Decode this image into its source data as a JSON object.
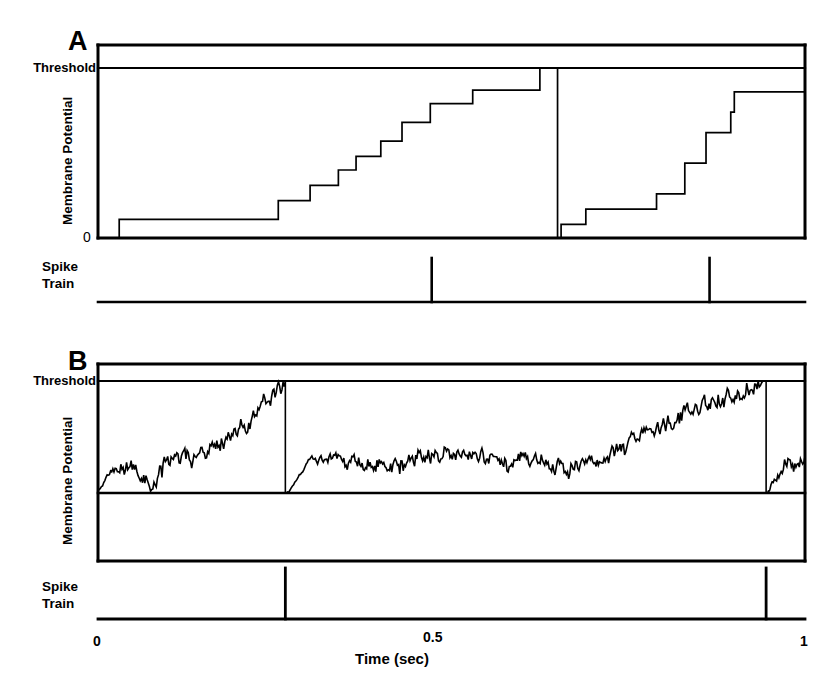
{
  "figure": {
    "background_color": "#ffffff",
    "line_color": "#000000"
  },
  "panels": [
    {
      "id": "A",
      "letter": "A",
      "threshold_label": "Threshold",
      "y_axis_label": "Membrane Potential",
      "zero_label": "0",
      "spike_train_label_line1": "Spike",
      "spike_train_label_line2": "Train",
      "description": "Noiseless integrate-and-fire: membrane potential rises in discrete steps to threshold, then resets"
    },
    {
      "id": "B",
      "letter": "B",
      "threshold_label": "Threshold",
      "y_axis_label": "Membrane Potential",
      "spike_train_label_line1": "Spike",
      "spike_train_label_line2": "Train",
      "description": "Noisy integrate-and-fire: membrane potential performs a random walk to threshold, then resets"
    }
  ],
  "x_axis": {
    "title": "Time (sec)",
    "ticks": [
      "0",
      "0.5",
      "1"
    ],
    "tick_values": [
      0,
      0.5,
      1
    ],
    "range": [
      0,
      1
    ],
    "units": "sec"
  },
  "chart_data": {
    "type": "line",
    "xlabel": "Time (sec)",
    "ylabel": "Membrane Potential",
    "xlim": [
      0,
      1
    ],
    "ylim": [
      0,
      1.15
    ],
    "grid": false,
    "legend": null,
    "xtick_labels": [
      "0",
      "0.5",
      "1"
    ],
    "xtick_values": [
      0,
      0.5,
      1
    ],
    "annotations": [
      {
        "text": "Threshold",
        "y": 1.0,
        "panel": "A"
      },
      {
        "text": "0",
        "y": 0.0,
        "panel": "A"
      },
      {
        "text": "Threshold",
        "y": 1.0,
        "panel": "B"
      }
    ],
    "series": [
      {
        "name": "Membrane Potential A (staircase)",
        "panel": "A",
        "style": "step-post",
        "x": [
          0.0,
          0.03,
          0.03,
          0.255,
          0.255,
          0.3,
          0.3,
          0.34,
          0.34,
          0.365,
          0.365,
          0.4,
          0.4,
          0.43,
          0.43,
          0.47,
          0.47,
          0.53,
          0.53,
          0.625,
          0.625,
          0.65,
          0.65,
          0.655,
          0.655,
          0.69,
          0.69,
          0.79,
          0.79,
          0.83,
          0.83,
          0.86,
          0.86,
          0.88,
          0.88,
          0.895,
          0.895,
          0.9,
          0.9,
          1.0
        ],
        "y": [
          0.0,
          0.0,
          0.11,
          0.11,
          0.22,
          0.22,
          0.31,
          0.31,
          0.4,
          0.4,
          0.48,
          0.48,
          0.57,
          0.57,
          0.68,
          0.68,
          0.79,
          0.79,
          0.87,
          0.87,
          1.0,
          1.0,
          0.0,
          0.0,
          0.08,
          0.08,
          0.17,
          0.17,
          0.26,
          0.26,
          0.44,
          0.44,
          0.62,
          0.62,
          0.62,
          0.62,
          0.74,
          0.74,
          0.86,
          0.86
        ],
        "reset_times": [
          0.47,
          0.865
        ],
        "threshold": 1.0,
        "reset_value": 0.0
      },
      {
        "name": "Spike Train A",
        "panel": "A",
        "style": "impulse",
        "spike_times": [
          0.472,
          0.865
        ],
        "spike_amplitude": 1.0
      },
      {
        "name": "Membrane Potential B (noisy random walk)",
        "panel": "B",
        "style": "line-noisy",
        "threshold": 1.0,
        "reset_value": 0.0,
        "reset_times": [
          0.265,
          0.945
        ],
        "envelope_x": [
          0.0,
          0.02,
          0.04,
          0.06,
          0.08,
          0.1,
          0.12,
          0.14,
          0.16,
          0.18,
          0.2,
          0.22,
          0.24,
          0.26
        ],
        "envelope_y": [
          0.02,
          0.18,
          0.25,
          0.12,
          0.08,
          0.3,
          0.34,
          0.28,
          0.42,
          0.47,
          0.58,
          0.68,
          0.82,
          0.98
        ],
        "envelope2_x": [
          0.27,
          0.3,
          0.34,
          0.38,
          0.42,
          0.46,
          0.5,
          0.54,
          0.58,
          0.62,
          0.66,
          0.7,
          0.74,
          0.78,
          0.82,
          0.86,
          0.9,
          0.94
        ],
        "envelope2_y": [
          0.01,
          0.3,
          0.28,
          0.25,
          0.22,
          0.34,
          0.42,
          0.3,
          0.26,
          0.3,
          0.24,
          0.28,
          0.38,
          0.54,
          0.68,
          0.8,
          0.88,
          0.98
        ],
        "envelope3_x": [
          0.95,
          0.97,
          0.99,
          1.0
        ],
        "envelope3_y": [
          0.02,
          0.3,
          0.26,
          0.3
        ],
        "noise_amplitude": 0.06
      },
      {
        "name": "Spike Train B",
        "panel": "B",
        "style": "impulse",
        "spike_times": [
          0.265,
          0.945
        ],
        "spike_amplitude": 1.0
      }
    ]
  }
}
